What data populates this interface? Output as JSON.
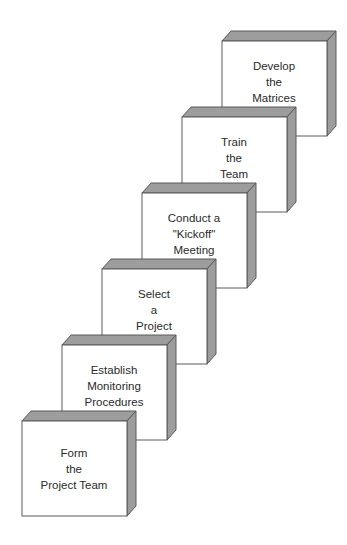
{
  "diagram": {
    "type": "staircase",
    "face_color": "#ffffff",
    "shade_color": "#9d9d9d",
    "edge_color": "#5a5a5a",
    "steps": [
      {
        "lines": [
          "Form",
          "the",
          "Project Team"
        ]
      },
      {
        "lines": [
          "Establish",
          "Monitoring",
          "Procedures"
        ]
      },
      {
        "lines": [
          "Select",
          "a",
          "Project"
        ]
      },
      {
        "lines": [
          "Conduct a",
          "\"Kickoff\"",
          "Meeting"
        ]
      },
      {
        "lines": [
          "Train",
          "the",
          "Team"
        ]
      },
      {
        "lines": [
          "Develop",
          "the",
          "Matrices"
        ]
      }
    ]
  }
}
